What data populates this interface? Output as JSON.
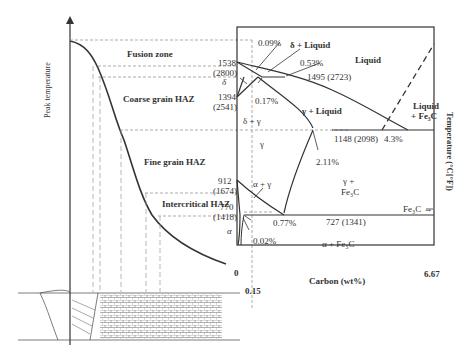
{
  "left_panel": {
    "ylabel": "Peak temperature",
    "zones": [
      "Fusion zone",
      "Coarse grain HAZ",
      "Fine grain HAZ",
      "Intercritical HAZ"
    ]
  },
  "phase_diagram": {
    "xlabel": "Carbon (wt%)",
    "ylabel": "Temperature (°C[°F])",
    "x_ticks": [
      "0",
      "0.15",
      "6.67"
    ],
    "temps": {
      "t1538": "1538",
      "t1538f": "(2800)",
      "t1394": "1394",
      "t1394f": "(2541)",
      "t912": "912",
      "t912f": "(1674)",
      "t770": "770",
      "t770f": "(1418)",
      "t1495": "1495 (2723)",
      "t1148": "1148 (2098)",
      "t727": "727 (1341)"
    },
    "compositions": {
      "c009": "0.09%",
      "c053": "0.53%",
      "c017": "0.17%",
      "c211": "2.11%",
      "c43": "4.3%",
      "c077": "0.77%",
      "c002": "0.02%"
    },
    "regions": {
      "liquid": "Liquid",
      "delta_liquid": "δ + Liquid",
      "delta": "δ",
      "delta_gamma": "δ + γ",
      "gamma": "γ",
      "gamma_liquid": "γ + Liquid",
      "liquid_fe3c_1": "Liquid",
      "liquid_fe3c_2": "+ Fe₃C",
      "gamma_fe3c_1": "γ +",
      "gamma_fe3c_2": "Fe₃C",
      "alpha_gamma": "α + γ",
      "alpha": "α",
      "alpha_fe3c": "α + Fe₃C",
      "fe3c": "Fe₃C →"
    }
  }
}
